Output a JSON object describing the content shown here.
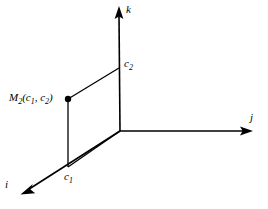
{
  "figure": {
    "type": "3d-axes-diagram",
    "background_color": "#ffffff",
    "stroke_color": "#000000",
    "width": 268,
    "height": 209,
    "axes": [
      {
        "name": "i-axis",
        "label": "i",
        "direction": "down-left",
        "origin": [
          120,
          131
        ],
        "tip": [
          21,
          194
        ],
        "arrowhead": true
      },
      {
        "name": "j-axis",
        "label": "j",
        "direction": "right",
        "origin": [
          120,
          131
        ],
        "tip": [
          252,
          131
        ],
        "arrowhead": true
      },
      {
        "name": "k-axis",
        "label": "k",
        "direction": "up",
        "origin": [
          120,
          131
        ],
        "tip": [
          119,
          8
        ],
        "arrowhead": true
      }
    ],
    "parallelogram": {
      "name": "coordinate-plane-parallelogram",
      "vertices": [
        [
          68,
          99
        ],
        [
          119,
          68
        ],
        [
          120,
          131
        ],
        [
          68,
          167
        ]
      ]
    },
    "point": {
      "name": "point-m2",
      "position": [
        68,
        99
      ],
      "radius": 3,
      "filled": true
    },
    "labels": {
      "k": "k",
      "j": "j",
      "i": "i",
      "c1_base": "c",
      "c1_sub": "1",
      "c2_base": "c",
      "c2_sub": "2",
      "m2_base": "M",
      "m2_sub": "2",
      "m2_open": "(",
      "m2_arg1_base": "c",
      "m2_arg1_sub": "1",
      "m2_comma": ", ",
      "m2_arg2_base": "c",
      "m2_arg2_sub": "2",
      "m2_close": ")"
    }
  }
}
